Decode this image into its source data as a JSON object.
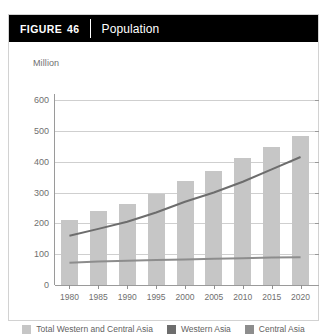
{
  "figure": {
    "tag_word": "FIGURE",
    "tag_number": "46",
    "title": "Population"
  },
  "chart_data": {
    "type": "bar",
    "title": "Population",
    "xlabel": "",
    "ylabel": "Million",
    "ylim": [
      0,
      600
    ],
    "yticks": [
      0,
      100,
      200,
      300,
      400,
      500,
      600
    ],
    "ytick_labels": [
      "0",
      "100",
      "200",
      "300",
      "400",
      "500",
      "600"
    ],
    "grid": true,
    "legend_position": "bottom",
    "categories": [
      "1980",
      "1985",
      "1990",
      "1995",
      "2000",
      "2005",
      "2010",
      "2015",
      "2020"
    ],
    "series": [
      {
        "name": "Total Western and Central Asia",
        "render": "bar",
        "color": "#c6c6c6",
        "values": [
          210,
          240,
          262,
          295,
          337,
          370,
          412,
          448,
          482
        ]
      },
      {
        "name": "Western Asia",
        "render": "line",
        "color": "#6d6d6d",
        "values": [
          160,
          182,
          205,
          235,
          270,
          300,
          335,
          375,
          415
        ]
      },
      {
        "name": "Central Asia",
        "render": "line",
        "color": "#8d8d8d",
        "values": [
          72,
          76,
          79,
          81,
          83,
          85,
          87,
          89,
          90
        ]
      }
    ]
  },
  "legend": [
    {
      "label": "Total Western and Central Asia",
      "color": "#c6c6c6"
    },
    {
      "label": "Western Asia",
      "color": "#6d6d6d"
    },
    {
      "label": "Central Asia",
      "color": "#8d8d8d"
    }
  ]
}
